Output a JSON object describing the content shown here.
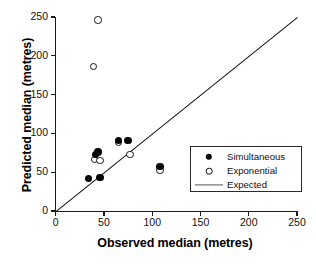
{
  "chart_data": {
    "type": "scatter",
    "title": "",
    "xlabel": "Observed median (metres)",
    "ylabel": "Predicted median (metres)",
    "xlim": [
      0,
      250
    ],
    "ylim": [
      0,
      250
    ],
    "xticks": [
      0,
      50,
      100,
      150,
      200,
      250
    ],
    "yticks": [
      0,
      50,
      100,
      150,
      200,
      250
    ],
    "xtick_labels": [
      "0",
      "50",
      "100",
      "150",
      "200",
      "250"
    ],
    "ytick_labels": [
      "0",
      "50",
      "100",
      "150",
      "200",
      "250"
    ],
    "grid": false,
    "legend_position": "lower right",
    "series": [
      {
        "name": "Simultaneous",
        "marker": "filled-circle",
        "color": "#050505",
        "points": [
          {
            "x": 34,
            "y": 42
          },
          {
            "x": 46,
            "y": 43
          },
          {
            "x": 41,
            "y": 73
          },
          {
            "x": 44,
            "y": 76
          },
          {
            "x": 65,
            "y": 91
          },
          {
            "x": 75,
            "y": 91
          },
          {
            "x": 108,
            "y": 57
          }
        ]
      },
      {
        "name": "Exponential",
        "marker": "open-circle",
        "color": "#111111",
        "points": [
          {
            "x": 44,
            "y": 246
          },
          {
            "x": 39,
            "y": 186
          },
          {
            "x": 40,
            "y": 66
          },
          {
            "x": 46,
            "y": 65
          },
          {
            "x": 65,
            "y": 88
          },
          {
            "x": 77,
            "y": 73
          },
          {
            "x": 108,
            "y": 53
          }
        ]
      },
      {
        "name": "Expected",
        "marker": "line",
        "color": "#111111",
        "line": {
          "x0": 0,
          "y0": 0,
          "x1": 250,
          "y1": 250,
          "description": "1:1 identity line"
        }
      }
    ]
  },
  "legend": {
    "items": [
      {
        "label": "Simultaneous",
        "symbol": "filled-circle"
      },
      {
        "label": "Exponential",
        "symbol": "open-circle"
      },
      {
        "label": "Expected",
        "symbol": "line"
      }
    ]
  },
  "axes": {
    "x_title": "Observed median (metres)",
    "y_title": "Predicted median (metres)"
  }
}
